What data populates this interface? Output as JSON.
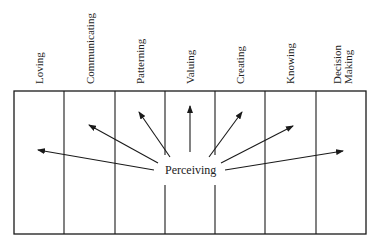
{
  "diagram": {
    "center_label": "Perceiving",
    "columns": [
      {
        "label": "Loving"
      },
      {
        "label": "Communicating"
      },
      {
        "label": "Patterning"
      },
      {
        "label": "Valuing"
      },
      {
        "label": "Creating"
      },
      {
        "label": "Knowing"
      },
      {
        "label": "Decision\nMaking"
      }
    ],
    "colors": {
      "line": "#1a1a1a",
      "background": "#ffffff"
    }
  }
}
